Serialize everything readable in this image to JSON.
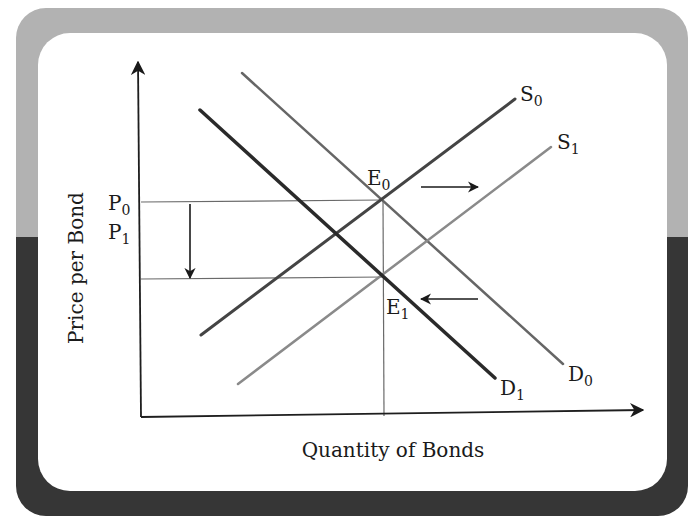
{
  "chart_data": {
    "type": "line",
    "title": "",
    "xlabel": "Quantity of Bonds",
    "ylabel": "Price per Bond",
    "grid": false,
    "series": [
      {
        "name": "S0",
        "label": "S",
        "sub": "0",
        "kind": "supply",
        "from": [
          201,
          335
        ],
        "to": [
          515,
          99
        ],
        "color": "#444444",
        "width": 3
      },
      {
        "name": "S1",
        "label": "S",
        "sub": "1",
        "kind": "supply",
        "from": [
          238,
          384
        ],
        "to": [
          551,
          147
        ],
        "color": "#8a8a8a",
        "width": 2.5
      },
      {
        "name": "D0",
        "label": "D",
        "sub": "0",
        "kind": "demand",
        "from": [
          242,
          73
        ],
        "to": [
          563,
          364
        ],
        "color": "#666666",
        "width": 2.5
      },
      {
        "name": "D1",
        "label": "D",
        "sub": "1",
        "kind": "demand",
        "from": [
          200,
          110
        ],
        "to": [
          495,
          378
        ],
        "color": "#2a2a2a",
        "width": 3.5
      }
    ],
    "equilibria": [
      {
        "name": "E0",
        "label": "E",
        "sub": "0",
        "point": [
          383,
          200
        ]
      },
      {
        "name": "E1",
        "label": "E",
        "sub": "1",
        "point": [
          384,
          276
        ]
      }
    ],
    "price_levels": [
      {
        "name": "P0",
        "label": "P",
        "sub": "0",
        "y": 200
      },
      {
        "name": "P1",
        "label": "P",
        "sub": "1",
        "y": 278
      }
    ],
    "annotations": [
      {
        "name": "price-drop-arrow",
        "direction": "down",
        "from": [
          190,
          204
        ],
        "to": [
          190,
          278
        ]
      },
      {
        "name": "supply-shift-arrow",
        "direction": "right",
        "from": [
          420,
          187
        ],
        "to": [
          478,
          187
        ]
      },
      {
        "name": "demand-shift-arrow",
        "direction": "left",
        "from": [
          478,
          299
        ],
        "to": [
          420,
          299
        ]
      }
    ]
  },
  "labels": {
    "y_axis": "Price per Bond",
    "x_axis": "Quantity of Bonds",
    "p0": {
      "main": "P",
      "sub": "0"
    },
    "p1": {
      "main": "P",
      "sub": "1"
    },
    "e0": {
      "main": "E",
      "sub": "0"
    },
    "e1": {
      "main": "E",
      "sub": "1"
    },
    "s0": {
      "main": "S",
      "sub": "0"
    },
    "s1": {
      "main": "S",
      "sub": "1"
    },
    "d0": {
      "main": "D",
      "sub": "0"
    },
    "d1": {
      "main": "D",
      "sub": "1"
    }
  },
  "colors": {
    "frame_top": "#b0b0b0",
    "frame_bottom": "#3a3a3a",
    "panel": "#ffffff",
    "axis": "#1e1e1e",
    "guide": "#6a6a6a"
  }
}
